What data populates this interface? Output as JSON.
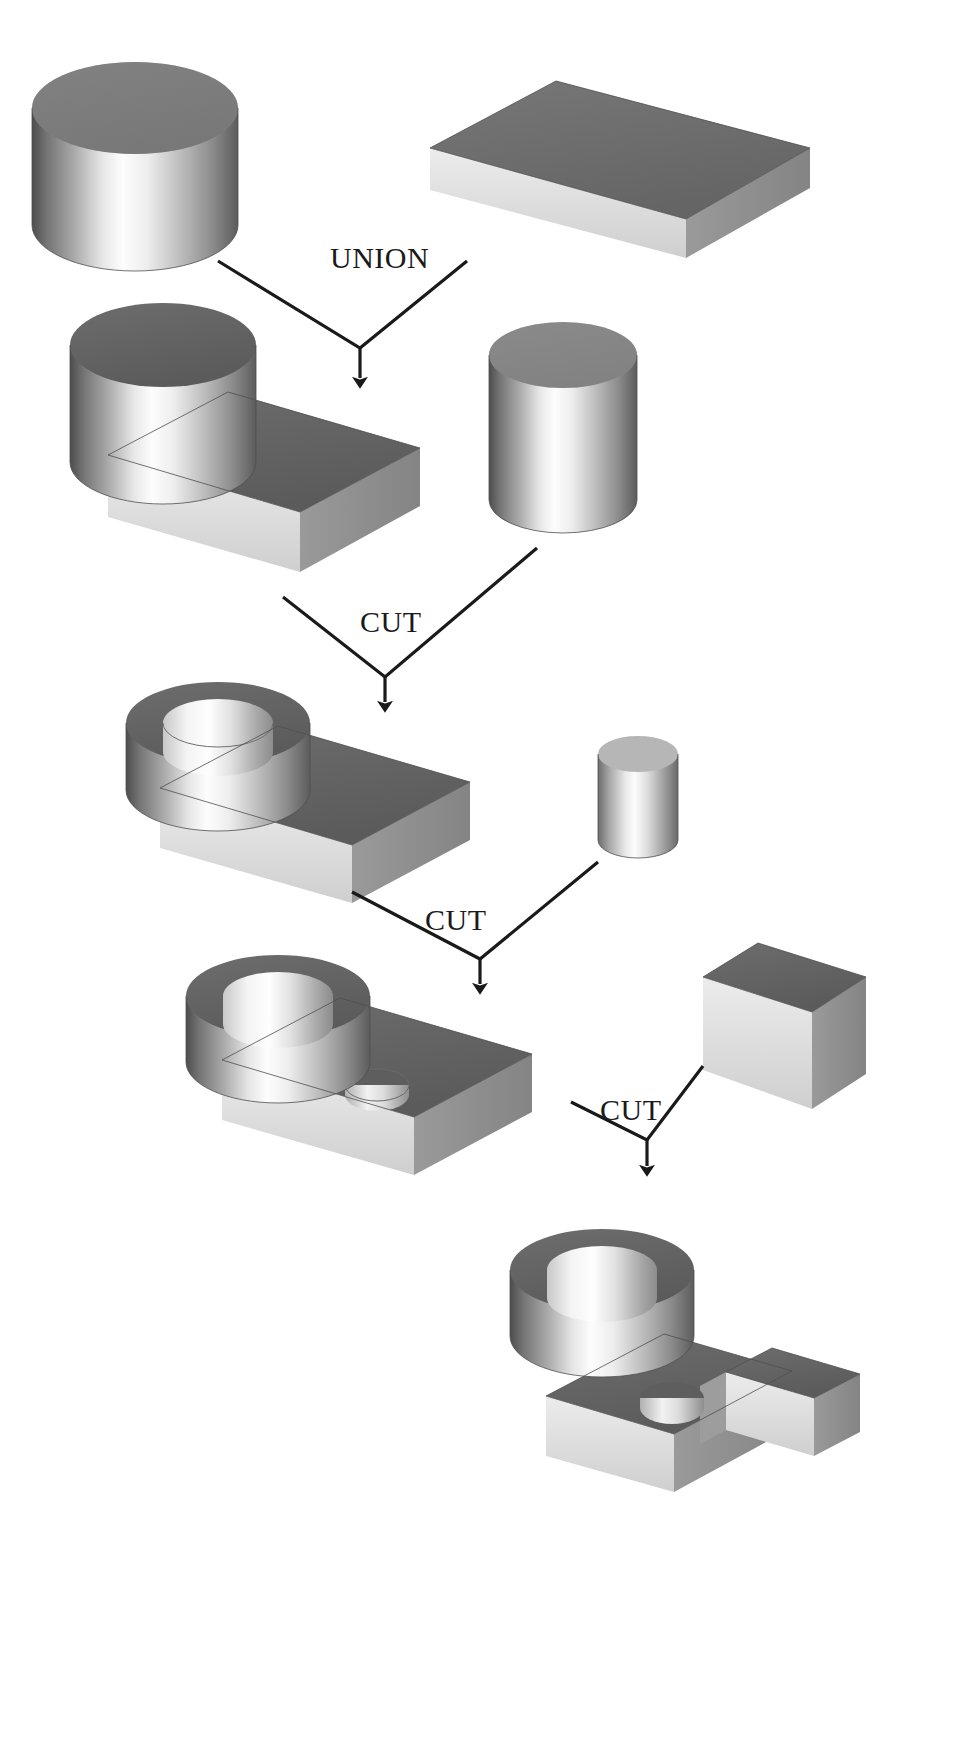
{
  "diagram": {
    "type": "csg-tree",
    "background_color": "#ffffff",
    "line_color": "#1a1a1a",
    "palette": {
      "top_face_dark": "#6f6f6f",
      "top_face_darker": "#5e5e5e",
      "front_face_light": "#f2f2f2",
      "front_face_mid": "#b8b8b8",
      "side_face_mid": "#8e8e8e",
      "bore_light": "#fafafa",
      "bore_shadow": "#9a9a9a",
      "cylinder_highlight": "#fdfdfd",
      "cylinder_shadow": "#5a5a5a"
    },
    "operations": [
      {
        "id": "op-union-1",
        "label": "UNION",
        "x": 330,
        "y": 268
      },
      {
        "id": "op-cut-1",
        "label": "CUT",
        "x": 360,
        "y": 632
      },
      {
        "id": "op-cut-2",
        "label": "CUT",
        "x": 425,
        "y": 930
      },
      {
        "id": "op-cut-3",
        "label": "CUT",
        "x": 600,
        "y": 1120
      }
    ],
    "shapes": [
      {
        "id": "cylinder-large-1",
        "name": "cylinder",
        "row": 1,
        "side": "left",
        "role": "operand"
      },
      {
        "id": "box-plate-1",
        "name": "box",
        "row": 1,
        "side": "right",
        "role": "operand"
      },
      {
        "id": "union-result-1",
        "name": "cylinder-on-plate",
        "row": 2,
        "side": "left",
        "role": "result"
      },
      {
        "id": "cylinder-tool-1",
        "name": "cylinder",
        "row": 2,
        "side": "right",
        "role": "tool"
      },
      {
        "id": "cut-result-1",
        "name": "hollow-cylinder-on-plate",
        "row": 3,
        "side": "left",
        "role": "result"
      },
      {
        "id": "cylinder-tool-2",
        "name": "small-cylinder",
        "row": 3,
        "side": "right",
        "role": "tool"
      },
      {
        "id": "cut-result-2",
        "name": "hollow-cylinder-on-plate-with-hole",
        "row": 4,
        "side": "left",
        "role": "result"
      },
      {
        "id": "box-tool-1",
        "name": "box-slab",
        "row": 4,
        "side": "right",
        "role": "tool"
      },
      {
        "id": "cut-result-3",
        "name": "final-part",
        "row": 5,
        "side": "right",
        "role": "result"
      }
    ],
    "connectors": [
      {
        "id": "conn-union-1",
        "op": "op-union-1",
        "left_from": [
          218,
          261
        ],
        "right_from": [
          467,
          261
        ],
        "junction": [
          360,
          348
        ],
        "arrow_to": [
          360,
          399
        ]
      },
      {
        "id": "conn-cut-1",
        "op": "op-cut-1",
        "left_from": [
          283,
          597
        ],
        "right_from": [
          537,
          548
        ],
        "junction": [
          385,
          677
        ],
        "arrow_to": [
          385,
          722
        ]
      },
      {
        "id": "conn-cut-2",
        "op": "op-cut-2",
        "left_from": [
          352,
          892
        ],
        "right_from": [
          598,
          862
        ],
        "junction": [
          480,
          959
        ],
        "arrow_to": [
          480,
          1004
        ]
      },
      {
        "id": "conn-cut-3",
        "op": "op-cut-3",
        "left_from": [
          571,
          1102
        ],
        "right_from": [
          703,
          1066
        ],
        "junction": [
          647,
          1291
        ],
        "arrow_to": [
          647,
          1181
        ]
      }
    ]
  }
}
